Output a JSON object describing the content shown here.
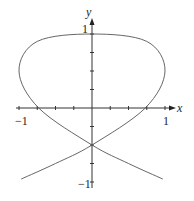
{
  "chart_data": {
    "type": "line",
    "title": "",
    "xlabel": "x",
    "ylabel": "y",
    "xlim": [
      -1.1,
      1.1
    ],
    "ylim": [
      -1,
      1.05
    ],
    "grid": false,
    "x_ticks": [
      -1,
      -0.75,
      -0.5,
      -0.25,
      0,
      0.25,
      0.5,
      0.75,
      1
    ],
    "y_ticks": [
      -1,
      -0.75,
      -0.5,
      -0.25,
      0,
      0.25,
      0.5,
      0.75,
      1
    ],
    "x_tick_labels": [
      "-1",
      "1"
    ],
    "y_tick_labels": [
      "1",
      "-1"
    ],
    "series": [
      {
        "name": "parametric curve",
        "x": [
          -0.97,
          -0.5,
          0,
          0.73,
          1.0,
          0.75,
          0,
          -0.75,
          -1.0,
          -0.73,
          0,
          0.5,
          0.97
        ],
        "y": [
          -0.96,
          -0.75,
          -0.5,
          0,
          0.5,
          0.9,
          1.0,
          0.9,
          0.5,
          0,
          -0.5,
          -0.75,
          -0.96
        ]
      }
    ],
    "annotations": [
      "self-intersection at (0, -0.5)"
    ]
  },
  "labels": {
    "x_axis": "x",
    "y_axis": "y",
    "x_min": "−1",
    "x_max": "1",
    "y_max": "1",
    "y_min": "−1"
  }
}
